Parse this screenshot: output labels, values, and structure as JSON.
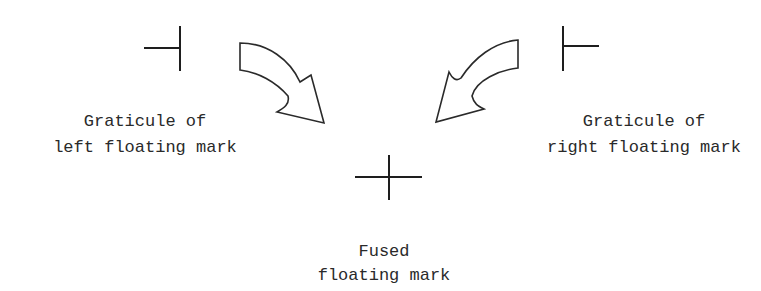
{
  "diagram": {
    "left_label": {
      "line1": "Graticule of",
      "line2": "left floating mark"
    },
    "right_label": {
      "line1": "Graticule of",
      "line2": "right floating mark"
    },
    "fused_label": {
      "line1": "Fused",
      "line2": "floating mark"
    },
    "marks": {
      "left": "left-half graticule (horizontal line ending at vertical bar)",
      "right": "right-half graticule (vertical bar with horizontal line to right)",
      "fused": "full cross graticule"
    },
    "arrows": [
      {
        "name": "left-curved-arrow",
        "direction": "down-right"
      },
      {
        "name": "right-curved-arrow",
        "direction": "down-left"
      }
    ],
    "colors": {
      "stroke": "#1e1e1e",
      "text": "#2a2a2a",
      "background": "#ffffff"
    }
  }
}
